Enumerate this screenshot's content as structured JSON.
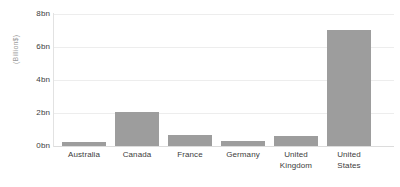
{
  "chart_data": {
    "type": "bar",
    "title": "",
    "subtitle": "",
    "xlabel": "",
    "ylabel": "(Billion$)",
    "categories": [
      "Australia",
      "Canada",
      "France",
      "Germany",
      "United Kingdom",
      "United States"
    ],
    "values": [
      0.25,
      2.05,
      0.65,
      0.3,
      0.6,
      7.05
    ],
    "ylim": [
      0,
      8
    ],
    "ytick_values": [
      0,
      2,
      4,
      6,
      8
    ],
    "ytick_labels": [
      "0bn",
      "2bn",
      "4bn",
      "6bn",
      "8bn"
    ],
    "grid": true,
    "legend": "none",
    "bar_color": "#9d9d9d",
    "gridline_color": "#ededed",
    "axis_color": "#e2e2e2",
    "background_color": "#ffffff",
    "tick_label_color": "#3c3c3c",
    "axis_title_color": "#9a9a9a"
  },
  "category_label_lines": [
    [
      "Australia"
    ],
    [
      "Canada"
    ],
    [
      "France"
    ],
    [
      "Germany"
    ],
    [
      "United",
      "Kingdom"
    ],
    [
      "United",
      "States"
    ]
  ]
}
